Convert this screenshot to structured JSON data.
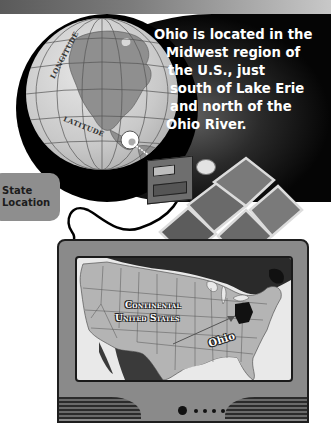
{
  "header_band": {
    "style": "gray-gradient"
  },
  "globe": {
    "labels": {
      "longitude": "LONGITUDE",
      "latitude": "LATITUDE"
    }
  },
  "info": {
    "lines": [
      "Ohio is located in the",
      "Midwest region of",
      "the U.S., just",
      "south of Lake Erie",
      "and north of the",
      "Ohio River."
    ]
  },
  "tab": {
    "line1": "State",
    "line2": "Location"
  },
  "tv": {
    "map": {
      "title_line1": "Continental",
      "title_line2": "United States",
      "highlight_label": "Ohio"
    },
    "indicator_dots": 4
  },
  "colors": {
    "panel_dark": "#050505",
    "tab_gray": "#8e8e8e",
    "tv_body": "#8a8a8a",
    "map_land": "#b4b4b4",
    "map_water": "#e9e9e9",
    "ohio_highlight": "#111111"
  }
}
